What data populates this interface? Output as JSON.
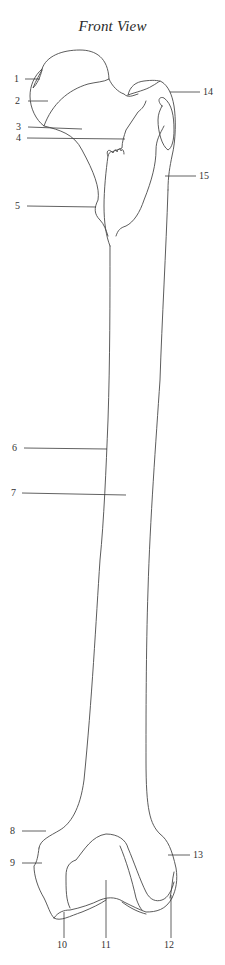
{
  "title": "Front View",
  "labels": [
    {
      "id": "1",
      "text": "1"
    },
    {
      "id": "2",
      "text": "2"
    },
    {
      "id": "3",
      "text": "3"
    },
    {
      "id": "4",
      "text": "4"
    },
    {
      "id": "5",
      "text": "5"
    },
    {
      "id": "6",
      "text": "6"
    },
    {
      "id": "7",
      "text": "7"
    },
    {
      "id": "8",
      "text": "8"
    },
    {
      "id": "9",
      "text": "9"
    },
    {
      "id": "10",
      "text": "10"
    },
    {
      "id": "11",
      "text": "11"
    },
    {
      "id": "12",
      "text": "12"
    },
    {
      "id": "13",
      "text": "13"
    },
    {
      "id": "14",
      "text": "14"
    },
    {
      "id": "15",
      "text": "15"
    }
  ],
  "colors": {
    "stroke": "#4a4a4a",
    "text": "#333333",
    "background": "#ffffff"
  }
}
